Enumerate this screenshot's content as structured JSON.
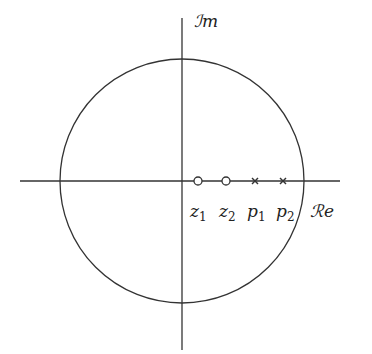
{
  "diagram": {
    "axes": {
      "real_label": "ℛe",
      "imag_label": "ℐm"
    },
    "circle": {
      "cx": 182,
      "cy": 181,
      "r": 122
    },
    "zeros": [
      {
        "label_base": "z",
        "label_sub": "1",
        "x": 198
      },
      {
        "label_base": "z",
        "label_sub": "2",
        "x": 226
      }
    ],
    "poles": [
      {
        "label_base": "p",
        "label_sub": "1",
        "x": 255
      },
      {
        "label_base": "p",
        "label_sub": "2",
        "x": 283
      }
    ],
    "colors": {
      "stroke": "#333333"
    }
  }
}
